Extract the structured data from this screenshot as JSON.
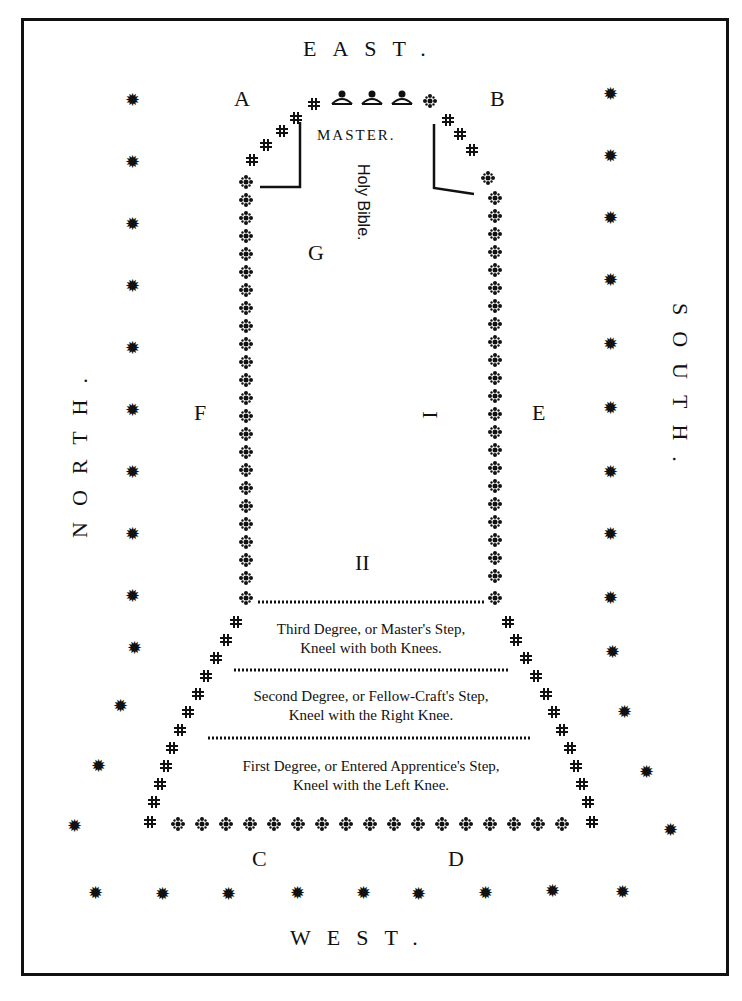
{
  "directions": {
    "east": "EAST.",
    "west": "WEST.",
    "north": "NORTH.",
    "south": "SOUTH."
  },
  "corner_labels": {
    "a": "A",
    "b": "B",
    "c": "C",
    "d": "D"
  },
  "side_labels": {
    "f": "F",
    "e": "E",
    "g": "G",
    "one": "I",
    "two": "II"
  },
  "master": "MASTER.",
  "bible": "Holy Bible.",
  "steps": [
    {
      "line1": "Third Degree, or Master's Step,",
      "line2": "Kneel with both Knees."
    },
    {
      "line1": "Second Degree, or Fellow-Craft's Step,",
      "line2": "Kneel with the Right Knee."
    },
    {
      "line1": "First Degree, or Entered Apprentice's Step,",
      "line2": "Kneel with the Left Knee."
    }
  ],
  "icons": {
    "candle": "✹",
    "ornament": "❖",
    "crown": "♛"
  },
  "colors": {
    "ink": "#111111",
    "paper": "#ffffff"
  }
}
